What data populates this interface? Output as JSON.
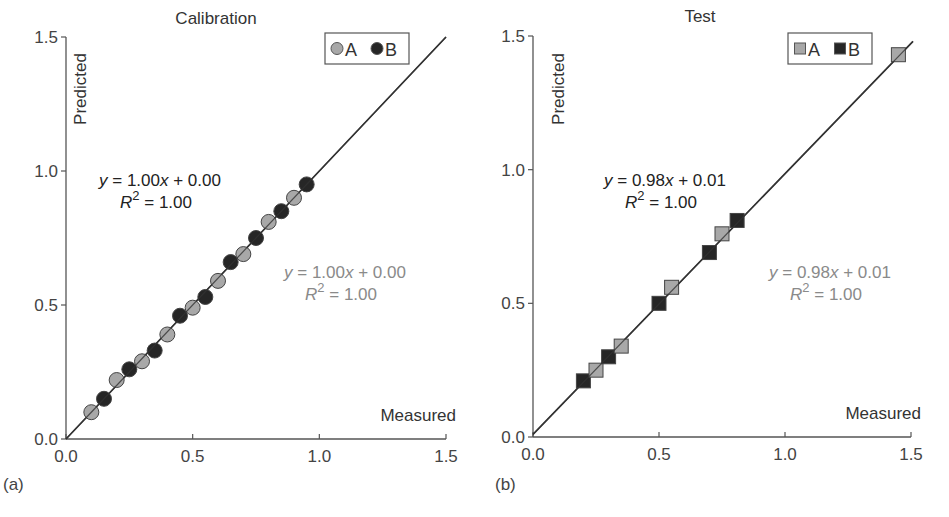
{
  "figure": {
    "panels": [
      {
        "id": "a",
        "panel_label": "(a)",
        "title": "Calibration",
        "xlabel": "Measured",
        "ylabel": "Predicted",
        "marker": "circle",
        "legend": [
          {
            "label": "A",
            "color": "#a8a8a8"
          },
          {
            "label": "B",
            "color": "#262626"
          }
        ],
        "eq_dark": {
          "line1": "y = 1.00x + 0.00",
          "line2": "R2 = 1.00"
        },
        "eq_light": {
          "line1": "y = 1.00x + 0.00",
          "line2": "R2 = 1.00"
        },
        "x_ticks": [
          "0.0",
          "0.5",
          "1.0",
          "1.5"
        ],
        "y_ticks": [
          "0.0",
          "0.5",
          "1.0",
          "1.5"
        ]
      },
      {
        "id": "b",
        "panel_label": "(b)",
        "title": "Test",
        "xlabel": "Measured",
        "ylabel": "Predicted",
        "marker": "square",
        "legend": [
          {
            "label": "A",
            "color": "#a8a8a8"
          },
          {
            "label": "B",
            "color": "#262626"
          }
        ],
        "eq_dark": {
          "line1": "y = 0.98x + 0.01",
          "line2": "R2 = 1.00"
        },
        "eq_light": {
          "line1": "y = 0.98x + 0.01",
          "line2": "R2 = 1.00"
        },
        "x_ticks": [
          "0.0",
          "0.5",
          "1.0",
          "1.5"
        ],
        "y_ticks": [
          "0.0",
          "0.5",
          "1.0",
          "1.5"
        ]
      }
    ]
  },
  "chart_data": [
    {
      "type": "scatter",
      "title": "Calibration",
      "panel": "(a)",
      "xlabel": "Measured",
      "ylabel": "Predicted",
      "xlim": [
        0,
        1.5
      ],
      "ylim": [
        0,
        1.5
      ],
      "grid": false,
      "legend_position": "top-right",
      "series": [
        {
          "name": "A",
          "marker": "circle",
          "color": "#a8a8a8",
          "x": [
            0.1,
            0.2,
            0.3,
            0.4,
            0.5,
            0.6,
            0.7,
            0.8,
            0.9
          ],
          "y": [
            0.1,
            0.22,
            0.29,
            0.39,
            0.49,
            0.59,
            0.69,
            0.81,
            0.9
          ]
        },
        {
          "name": "B",
          "marker": "circle",
          "color": "#262626",
          "x": [
            0.15,
            0.25,
            0.35,
            0.45,
            0.55,
            0.65,
            0.75,
            0.85,
            0.95
          ],
          "y": [
            0.15,
            0.26,
            0.33,
            0.46,
            0.53,
            0.66,
            0.75,
            0.85,
            0.95
          ]
        }
      ],
      "fit_line": {
        "slope": 1.0,
        "intercept": 0.0,
        "r2": 1.0
      },
      "annotations": [
        {
          "text": "y = 1.00x + 0.00; R^2 = 1.00",
          "series": "B",
          "color": "#222222"
        },
        {
          "text": "y = 1.00x + 0.00; R^2 = 1.00",
          "series": "A",
          "color": "#8a8a8a"
        }
      ]
    },
    {
      "type": "scatter",
      "title": "Test",
      "panel": "(b)",
      "xlabel": "Measured",
      "ylabel": "Predicted",
      "xlim": [
        0,
        1.5
      ],
      "ylim": [
        0,
        1.5
      ],
      "grid": false,
      "legend_position": "top-right",
      "series": [
        {
          "name": "A",
          "marker": "square",
          "color": "#a8a8a8",
          "x": [
            0.25,
            0.35,
            0.55,
            0.75,
            1.45
          ],
          "y": [
            0.25,
            0.34,
            0.56,
            0.76,
            1.43
          ]
        },
        {
          "name": "B",
          "marker": "square",
          "color": "#262626",
          "x": [
            0.2,
            0.3,
            0.5,
            0.7,
            0.81
          ],
          "y": [
            0.21,
            0.3,
            0.5,
            0.69,
            0.81
          ]
        }
      ],
      "fit_line": {
        "slope": 0.98,
        "intercept": 0.01,
        "r2": 1.0
      },
      "annotations": [
        {
          "text": "y = 0.98x + 0.01; R^2 = 1.00",
          "series": "B",
          "color": "#222222"
        },
        {
          "text": "y = 0.98x + 0.01; R^2 = 1.00",
          "series": "A",
          "color": "#8a8a8a"
        }
      ]
    }
  ]
}
